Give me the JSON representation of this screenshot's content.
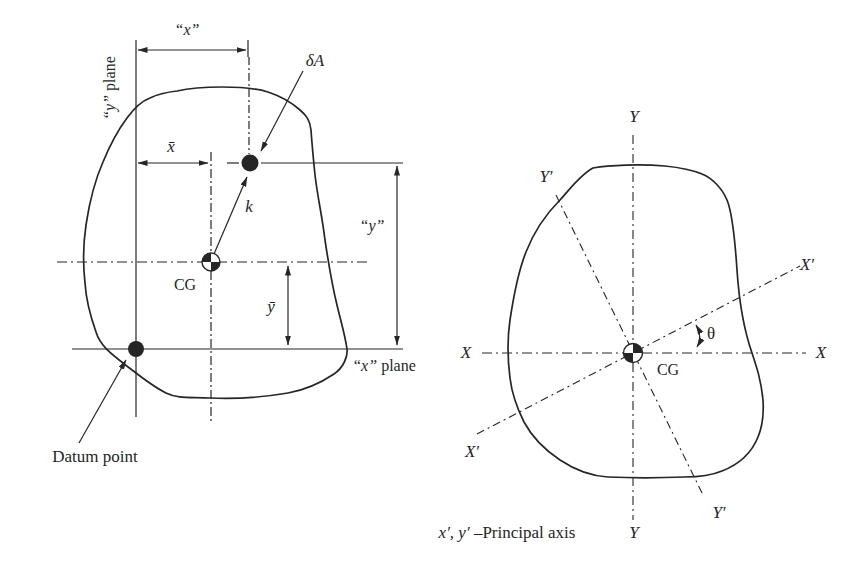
{
  "colors": {
    "ink": "#262626",
    "paper": "#ffffff"
  },
  "left_figure": {
    "y_plane_var": "“y”",
    "y_plane_rest": " plane",
    "x_width": "“x”",
    "delta_a": "δA",
    "x_bar": "x̄",
    "k": "k",
    "y_height": "“y”",
    "cg": "CG",
    "y_bar": "ȳ",
    "x_plane_var": "“x”",
    "x_plane_rest": " plane",
    "datum_point": "Datum point"
  },
  "right_figure": {
    "y_axis_top": "Y",
    "y_axis_bottom": "Y",
    "y_prime_top": "Y′",
    "y_prime_bottom": "Y′",
    "x_axis_left": "X",
    "x_axis_right": "X",
    "x_prime_top": "X′",
    "x_prime_bottom": "X′",
    "theta": "θ",
    "cg": "CG",
    "caption_var": "x′, y′",
    "caption_rest": " –Principal axis"
  }
}
